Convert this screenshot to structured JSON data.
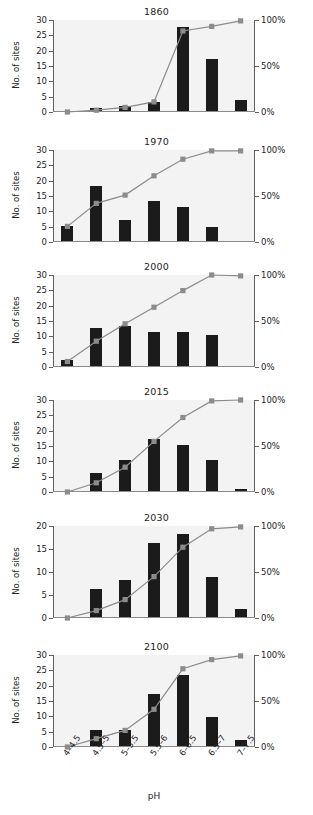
{
  "figure": {
    "ylabel": "No. of sites",
    "xlabel": "pH",
    "left_ticks_30": [
      "0",
      "5",
      "10",
      "15",
      "20",
      "25",
      "30"
    ],
    "left_ticks_20": [
      "0",
      "5",
      "10",
      "15",
      "20"
    ],
    "right_ticks": [
      "0%",
      "50%",
      "100%"
    ],
    "categories": [
      "4–4.5",
      "4.5–5",
      "5–5.5",
      "5.5–6",
      "6–6.5",
      "6.5–7",
      "7–7.5"
    ],
    "bar_color": "#1b1b1b",
    "line_color": "#8c8c8c",
    "marker_color": "#8c8c8c",
    "plot_bg": "#f3f3f3"
  },
  "chart_data": [
    {
      "type": "bar",
      "title": "1860",
      "xlabel": "pH",
      "ylabel": "No. of sites",
      "ylim": [
        0,
        30
      ],
      "y2lim": [
        0,
        100
      ],
      "y2label": "Cumulative %",
      "grid": false,
      "legend": "none",
      "categories": [
        "4–4.5",
        "4.5–5",
        "5–5.5",
        "5.5–6",
        "6–6.5",
        "6.5–7",
        "7–7.5"
      ],
      "series": [
        {
          "name": "No. of sites",
          "type": "bar",
          "values": [
            0,
            1,
            1.5,
            3,
            27.5,
            17,
            3.5
          ]
        },
        {
          "name": "Cumulative %",
          "type": "line",
          "values": [
            0,
            2,
            5,
            11,
            88,
            93,
            99
          ]
        }
      ]
    },
    {
      "type": "bar",
      "title": "1970",
      "xlabel": "pH",
      "ylabel": "No. of sites",
      "ylim": [
        0,
        30
      ],
      "y2lim": [
        0,
        100
      ],
      "y2label": "Cumulative %",
      "grid": false,
      "legend": "none",
      "categories": [
        "4–4.5",
        "4.5–5",
        "5–5.5",
        "5.5–6",
        "6–6.5",
        "6.5–7",
        "7–7.5"
      ],
      "series": [
        {
          "name": "No. of sites",
          "type": "bar",
          "values": [
            5,
            18,
            7,
            13,
            11,
            4.5,
            0
          ]
        },
        {
          "name": "Cumulative %",
          "type": "line",
          "values": [
            17,
            42,
            51,
            72,
            90,
            99,
            99
          ]
        }
      ]
    },
    {
      "type": "bar",
      "title": "2000",
      "xlabel": "pH",
      "ylabel": "No. of sites",
      "ylim": [
        0,
        30
      ],
      "y2lim": [
        0,
        100
      ],
      "y2label": "Cumulative %",
      "grid": false,
      "legend": "none",
      "categories": [
        "4–4.5",
        "4.5–5",
        "5–5.5",
        "5.5–6",
        "6–6.5",
        "6.5–7",
        "7–7.5"
      ],
      "series": [
        {
          "name": "No. of sites",
          "type": "bar",
          "values": [
            2,
            12.5,
            13,
            11,
            11,
            10,
            0
          ]
        },
        {
          "name": "Cumulative %",
          "type": "line",
          "values": [
            6,
            28,
            47,
            65,
            83,
            100,
            99
          ]
        }
      ]
    },
    {
      "type": "bar",
      "title": "2015",
      "xlabel": "pH",
      "ylabel": "No. of sites",
      "ylim": [
        0,
        30
      ],
      "y2lim": [
        0,
        100
      ],
      "y2label": "Cumulative %",
      "grid": false,
      "legend": "none",
      "categories": [
        "4–4.5",
        "4.5–5",
        "5–5.5",
        "5.5–6",
        "6–6.5",
        "6.5–7",
        "7–7.5"
      ],
      "series": [
        {
          "name": "No. of sites",
          "type": "bar",
          "values": [
            0,
            6,
            10,
            17,
            15,
            10,
            0.7
          ]
        },
        {
          "name": "Cumulative %",
          "type": "line",
          "values": [
            0,
            10,
            27,
            55,
            81,
            99,
            100
          ]
        }
      ]
    },
    {
      "type": "bar",
      "title": "2030",
      "xlabel": "pH",
      "ylabel": "No. of sites",
      "ylim": [
        0,
        20
      ],
      "y2lim": [
        0,
        100
      ],
      "y2label": "Cumulative %",
      "grid": false,
      "legend": "none",
      "categories": [
        "4–4.5",
        "4.5–5",
        "5–5.5",
        "5.5–6",
        "6–6.5",
        "6.5–7",
        "7–7.5"
      ],
      "series": [
        {
          "name": "No. of sites",
          "type": "bar",
          "values": [
            0,
            6,
            8,
            16,
            18,
            8.7,
            1.7
          ]
        },
        {
          "name": "Cumulative %",
          "type": "line",
          "values": [
            0,
            8,
            20,
            45,
            77,
            97,
            99
          ]
        }
      ]
    },
    {
      "type": "bar",
      "title": "2100",
      "xlabel": "pH",
      "ylabel": "No. of sites",
      "ylim": [
        0,
        30
      ],
      "y2lim": [
        0,
        100
      ],
      "y2label": "Cumulative %",
      "grid": false,
      "legend": "none",
      "categories": [
        "4–4.5",
        "4.5–5",
        "5–5.5",
        "5.5–6",
        "6–6.5",
        "6.5–7",
        "7–7.5"
      ],
      "series": [
        {
          "name": "No. of sites",
          "type": "bar",
          "values": [
            0,
            5.3,
            5.3,
            17,
            23,
            9.5,
            2
          ]
        },
        {
          "name": "Cumulative %",
          "type": "line",
          "values": [
            0,
            9,
            18,
            41,
            85,
            95,
            99
          ]
        }
      ]
    }
  ]
}
